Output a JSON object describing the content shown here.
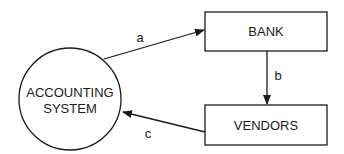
{
  "diagram": {
    "type": "flow",
    "nodes": [
      {
        "id": "accounting",
        "shape": "circle",
        "lines": [
          "ACCOUNTING",
          "SYSTEM"
        ]
      },
      {
        "id": "bank",
        "shape": "rectangle",
        "label": "BANK"
      },
      {
        "id": "vendors",
        "shape": "rectangle",
        "label": "VENDORS"
      }
    ],
    "edges": [
      {
        "id": "a",
        "label": "a",
        "from": "accounting",
        "to": "bank"
      },
      {
        "id": "b",
        "label": "b",
        "from": "bank",
        "to": "vendors"
      },
      {
        "id": "c",
        "label": "c",
        "from": "vendors",
        "to": "accounting"
      }
    ],
    "colors": {
      "stroke": "#1a1a1a",
      "background": "#ffffff"
    }
  }
}
